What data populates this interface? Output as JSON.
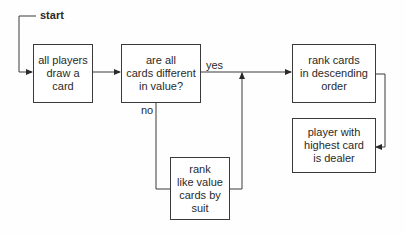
{
  "diagram": {
    "start_label": "start",
    "nodes": [
      {
        "id": "draw",
        "text": "all players\ndraw a\ncard"
      },
      {
        "id": "check",
        "text": "are all\ncards different\nin value?"
      },
      {
        "id": "rank_desc",
        "text": "rank cards\nin descending\norder"
      },
      {
        "id": "dealer",
        "text": "player with\nhighest card\nis dealer"
      },
      {
        "id": "rank_suit",
        "text": "rank\nlike value\ncards by\nsuit"
      }
    ],
    "edges": [
      {
        "from": "start",
        "to": "draw",
        "label": ""
      },
      {
        "from": "draw",
        "to": "check",
        "label": ""
      },
      {
        "from": "check",
        "to": "rank_desc",
        "label": "yes"
      },
      {
        "from": "check",
        "to": "rank_suit",
        "label": "no"
      },
      {
        "from": "rank_suit",
        "to": "rank_desc",
        "label": ""
      },
      {
        "from": "rank_desc",
        "to": "dealer",
        "label": ""
      }
    ],
    "yes_label": "yes",
    "no_label": "no"
  }
}
